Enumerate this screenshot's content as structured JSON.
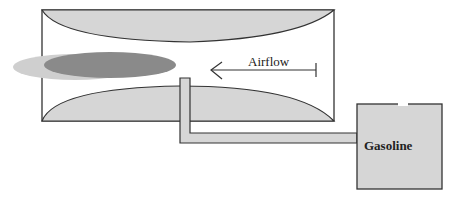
{
  "diagram": {
    "type": "carburetor-venturi-schematic",
    "labels": {
      "airflow": "Airflow",
      "tank": "Gasoline"
    },
    "components": [
      "venturi-tube",
      "fuel-spray",
      "fuel-line",
      "gasoline-tank",
      "airflow-arrow"
    ],
    "colors": {
      "fill_light": "#d6d6d6",
      "spray_dark": "#8a8a8a",
      "spray_light": "#cfcfcf",
      "stroke": "#333333"
    }
  }
}
